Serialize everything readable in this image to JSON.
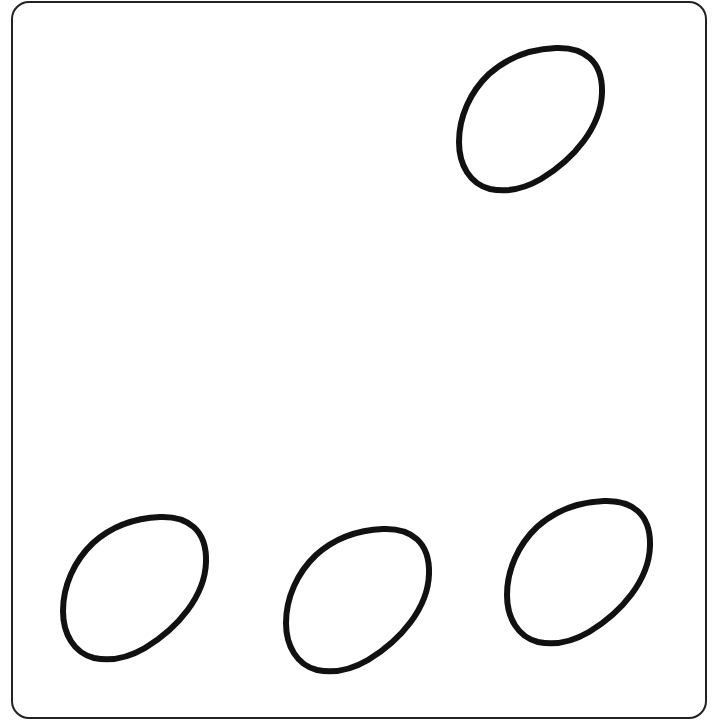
{
  "figure": {
    "frame": {
      "stroke": "#222222",
      "radius": 18
    },
    "shape": {
      "type": "egg-outline",
      "stroke": "#111111",
      "stroke_width": 6,
      "fill": "#ffffff"
    },
    "count": 4,
    "eggs": [
      {
        "id": "egg-top-right",
        "x": 456,
        "y": 45
      },
      {
        "id": "egg-bottom-left",
        "x": 60,
        "y": 514
      },
      {
        "id": "egg-bottom-middle",
        "x": 283,
        "y": 526
      },
      {
        "id": "egg-bottom-right",
        "x": 504,
        "y": 498
      }
    ]
  }
}
